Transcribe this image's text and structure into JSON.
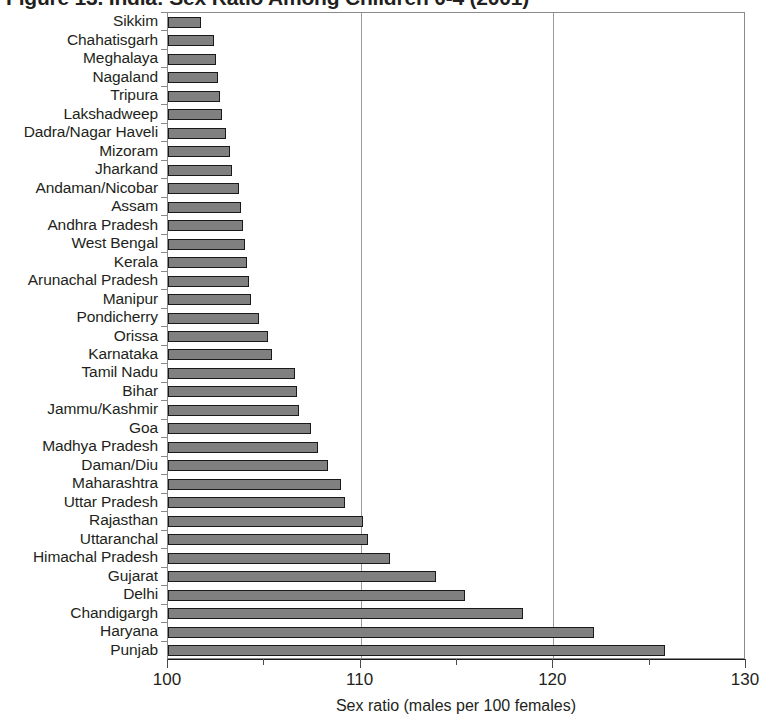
{
  "title": "Figure 13. India: Sex Ratio Among Children 0-4 (2001)",
  "axis": {
    "xlabel": "Sex ratio (males per 100 females)",
    "xticks": [
      100,
      110,
      120,
      130
    ],
    "xminor": [
      105,
      115,
      125
    ],
    "xmin": 100,
    "xmax": 130
  },
  "style": {
    "bar_fill": "#808080",
    "bar_stroke": "#1a1a1a",
    "frame": "#8a8a8a",
    "text": "#231f20"
  },
  "chart_data": {
    "type": "bar",
    "orientation": "horizontal",
    "title": "Figure 13. India: Sex Ratio Among Children 0-4 (2001)",
    "xlabel": "Sex ratio (males per 100 females)",
    "ylabel": "",
    "xlim": [
      100,
      130
    ],
    "xticks": [
      100,
      110,
      120,
      130
    ],
    "grid": "vertical gridlines at 110 and 120",
    "legend": "none",
    "categories": [
      "Sikkim",
      "Chahatisgarh",
      "Meghalaya",
      "Nagaland",
      "Tripura",
      "Lakshadweep",
      "Dadra/Nagar Haveli",
      "Mizoram",
      "Jharkand",
      "Andaman/Nicobar",
      "Assam",
      "Andhra Pradesh",
      "West Bengal",
      "Kerala",
      "Arunachal Pradesh",
      "Manipur",
      "Pondicherry",
      "Orissa",
      "Karnataka",
      "Tamil Nadu",
      "Bihar",
      "Jammu/Kashmir",
      "Goa",
      "Madhya Pradesh",
      "Daman/Diu",
      "Maharashtra",
      "Uttar Pradesh",
      "Rajasthan",
      "Uttaranchal",
      "Himachal Pradesh",
      "Gujarat",
      "Delhi",
      "Chandigargh",
      "Haryana",
      "Punjab"
    ],
    "values": [
      101.7,
      102.4,
      102.5,
      102.6,
      102.7,
      102.8,
      103.0,
      103.2,
      103.3,
      103.7,
      103.8,
      103.9,
      104.0,
      104.1,
      104.2,
      104.3,
      104.7,
      105.2,
      105.4,
      106.6,
      106.7,
      106.8,
      107.4,
      107.8,
      108.3,
      109.0,
      109.2,
      110.1,
      110.4,
      111.5,
      113.9,
      115.4,
      118.4,
      122.1,
      125.8
    ]
  }
}
